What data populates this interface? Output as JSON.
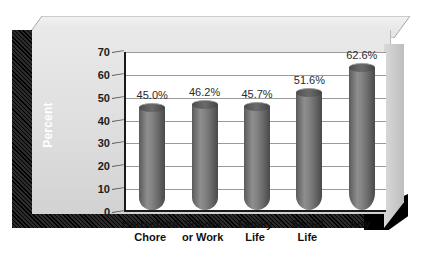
{
  "axis_title": "Percent",
  "chart_data": {
    "type": "bar",
    "title": "",
    "subtitle": "",
    "xlabel": "",
    "ylabel": "Percent",
    "ylim": [
      0,
      70
    ],
    "ytick_values": [
      0,
      10,
      20,
      30,
      40,
      50,
      60,
      70
    ],
    "ytick_labels": [
      "0",
      "10",
      "20",
      "30",
      "40",
      "50",
      "60",
      "70"
    ],
    "grid": true,
    "legend": false,
    "legend_position": "none",
    "style": "3d-cylinder",
    "categories": [
      "Household Chore",
      "School or Work",
      "Family Life",
      "Social Life",
      "Any"
    ],
    "category_lines": [
      [
        "Household",
        "Chore"
      ],
      [
        "School",
        "or Work"
      ],
      [
        "Family",
        "Life"
      ],
      [
        "Social",
        "Life"
      ],
      [
        "Any",
        ""
      ]
    ],
    "values": [
      45.0,
      46.2,
      45.7,
      51.6,
      62.6
    ],
    "data_labels": [
      "45.0%",
      "46.2%",
      "45.7%",
      "51.6%",
      "62.6%"
    ],
    "series": [
      {
        "name": "Percent",
        "values": [
          45.0,
          46.2,
          45.7,
          51.6,
          62.6
        ]
      }
    ]
  },
  "colors": {
    "bar_fill": "#6e6e6e",
    "bar_highlight": "#8e8e8e",
    "bar_shadow": "#4a4a4a",
    "plot_background": "#ffffff",
    "panel_background": "#dedede",
    "gridline": "#9a9a9a",
    "axis_line": "#1a1a1a",
    "frame_hatch": "#000000",
    "axis_title_text": "#ffffff",
    "tick_text": "#1b1b1b",
    "category_text": "#111111",
    "data_label_text": "#2a2a2a"
  }
}
